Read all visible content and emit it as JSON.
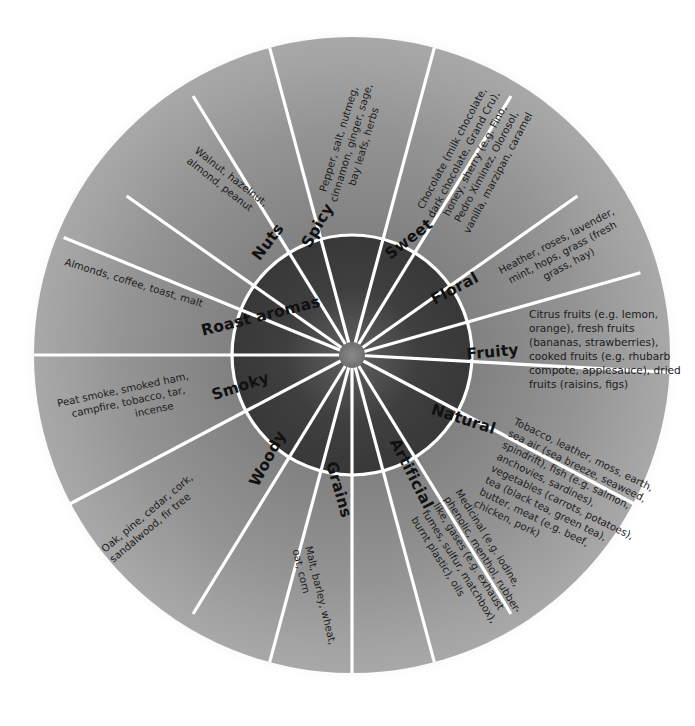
{
  "diagram": {
    "type": "radial-flavour-wheel",
    "segment_count": 12,
    "colors": {
      "background": "#ffffff",
      "divider": "#ffffff",
      "ring_border": "#ffffff",
      "inner_dark": "#3a3a3a",
      "inner_mid": "#585858",
      "outer_mid": "#8e8e8e",
      "outer_light": "#a8a8a8",
      "text": "#1b1b1b",
      "label_text": "#111111",
      "shadow": "#cfcfcf"
    },
    "geometry": {
      "center_x": 352,
      "center_y": 355,
      "hub_radius": 12,
      "inner_ring_radius": 120,
      "outer_ring_radius": 318
    }
  },
  "segments": [
    {
      "id": "spicy",
      "label": "Spicy",
      "description": "Pepper, salt, nutmeg, cinnamon, ginger, sage, bay leafs, herbs",
      "lines": [
        "Pepper, salt, nutmeg,",
        "cinnamon, ginger, sage,",
        "bay leafs, herbs"
      ]
    },
    {
      "id": "sweet",
      "label": "Sweet",
      "description": "Chocolate (milk chocolate, dark chocolate, Grand Cru), honey, sherry (e.g. Fino, Pedro Ximinez, Olorosol, vanilla, marzipan, caramel",
      "lines": [
        "Chocolate (milk chocolate,",
        "dark chocolate, Grand Cru),",
        "honey, sherry (e.g. Fino,",
        "Pedro Ximinez, Olorosol,",
        "vanilla, marzipan, caramel"
      ]
    },
    {
      "id": "floral",
      "label": "Floral",
      "description": "Heather, roses, lavender, mint, hops, grass (fresh grass, hay)",
      "lines": [
        "Heather, roses, lavender,",
        "mint, hops, grass (fresh",
        "grass, hay)"
      ]
    },
    {
      "id": "fruity",
      "label": "Fruity",
      "description": "Citrus fruits (e.g. lemon, orange), fresh fruits (bananas, strawberries), cooked fruits (e.g. rhubarb compote, applesauce), dried fruits (raisins, figs)",
      "lines": [
        "Citrus fruits (e.g. lemon,",
        "orange), fresh fruits",
        "(bananas, strawberries),",
        "cooked fruits (e.g. rhubarb",
        "compote, applesauce), dried",
        "fruits (raisins, figs)"
      ]
    },
    {
      "id": "natural",
      "label": "Natural",
      "description": "Tobacco, leather, moss, earth, sea air (sea breeze, seaweed, spindrift), fish (e.g. salmon, anchovies, sardines), vegetables (carrots, potatoes), tea (black tea, green tea), butter, meat (e.g. beef, chicken, pork)",
      "lines": [
        "Tobacco, leather, moss, earth,",
        "sea air (sea breeze, seaweed,",
        "spindrift), fish (e.g. salmon,",
        "anchovies, sardines),",
        "vegetables (carrots, potatoes),",
        "tea (black tea, green tea),",
        "butter, meat (e.g. beef,",
        "chicken, pork)"
      ]
    },
    {
      "id": "artificial",
      "label": "Artificial",
      "description": "Medicinal (e.g. iodine, phenolic, menthol, rubber-like, gases (e.g. exhaust fumes, sulfur, matchbox), burnt plastic), oils",
      "lines": [
        "Medicinal (e.g. iodine,",
        "phenolic, menthol, rubber-",
        "like, gases (e.g. exhaust",
        "fumes, sulfur, matchbox),",
        "burnt plastic), oils"
      ]
    },
    {
      "id": "grains",
      "label": "Grains",
      "description": "Malt, barley, wheat, oat, corn",
      "lines": [
        "Malt, barley, wheat,",
        "oat, corn"
      ]
    },
    {
      "id": "woody",
      "label": "Woody",
      "description": "Oak, pine, cedar, cork, sandalwood, fir tree",
      "lines": [
        "Oak, pine, cedar, cork,",
        "sandalwood, fir tree"
      ]
    },
    {
      "id": "smoky",
      "label": "Smoky",
      "description": "Peat smoke, smoked ham, campfire, tobacco, tar, incense",
      "lines": [
        "Peat smoke, smoked ham,",
        "campfire, tobacco, tar,",
        "incense"
      ]
    },
    {
      "id": "roast-aromas",
      "label": "Roast aromas",
      "description": "Almonds, coffee, toast, malt",
      "lines": [
        "Almonds, coffee, toast, malt"
      ]
    },
    {
      "id": "nuts",
      "label": "Nuts",
      "description": "Walnut, hazelnut, almond, peanut",
      "lines": [
        "Walnut, hazelnut,",
        "almond, peanut"
      ]
    }
  ]
}
